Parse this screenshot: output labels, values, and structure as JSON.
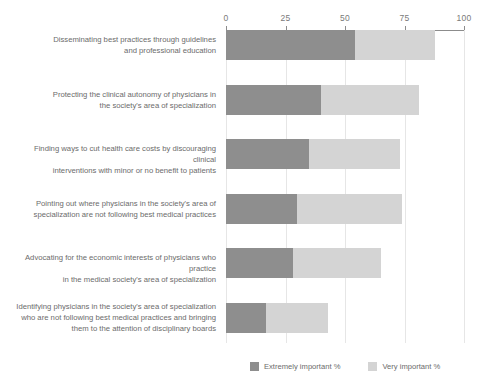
{
  "chart_data": {
    "type": "bar",
    "orientation": "horizontal",
    "stacked": true,
    "title": "",
    "xlabel": "",
    "ylabel": "",
    "xlim": [
      0,
      100
    ],
    "xticks": [
      0,
      25,
      50,
      75,
      100
    ],
    "xtick_labels": [
      "0",
      "25",
      "50",
      "75",
      "100"
    ],
    "grid": true,
    "legend_position": "bottom-right",
    "categories": [
      "Disseminating best practices through guidelines and professional education",
      "Protecting the clinical autonomy of physicians in the society's area of  specialization",
      "Finding ways to cut health care costs by discouraging clinical interventions with minor or no benefit to patients",
      "Pointing out where physicians in the society's area of specialization are not following best medical practices",
      "Advocating for the economic interests of physicians who practice in the medical society's area of specialization",
      "Identifying physicians in the society's area of specialization who are not following best medical practices and bringing them to the attention of disciplinary boards"
    ],
    "category_lines": [
      [
        "Disseminating best practices through guidelines",
        "and professional education"
      ],
      [
        "Protecting the clinical autonomy of physicians in",
        "the society's area of  specialization"
      ],
      [
        "Finding ways to cut health care costs by discouraging clinical",
        "interventions with minor or no benefit to patients"
      ],
      [
        "Pointing out where physicians in the society's area of",
        "specialization are not following best medical practices"
      ],
      [
        "Advocating for the economic interests of physicians who practice",
        "in the medical society's area of specialization"
      ],
      [
        "Identifying physicians in the society's area of specialization",
        "who are not following best medical practices and bringing",
        "them to the attention of disciplinary boards"
      ]
    ],
    "series": [
      {
        "name": "Extremely important %",
        "color": "#8e8e8e",
        "values": [
          54,
          40,
          35,
          30,
          28,
          17
        ]
      },
      {
        "name": "Very important %",
        "color": "#d4d4d4",
        "values": [
          34,
          41,
          38,
          44,
          37,
          26
        ]
      }
    ],
    "totals": [
      88,
      81,
      73,
      74,
      65,
      43
    ]
  },
  "legend": {
    "items": [
      {
        "label": "Extremely important %",
        "color": "#8e8e8e"
      },
      {
        "label": "Very important %",
        "color": "#d4d4d4"
      }
    ]
  },
  "axis": {
    "line_color": "#8c8c8c",
    "grid_color": "#e6e6e6",
    "tick_color": "#7a7a7a"
  }
}
